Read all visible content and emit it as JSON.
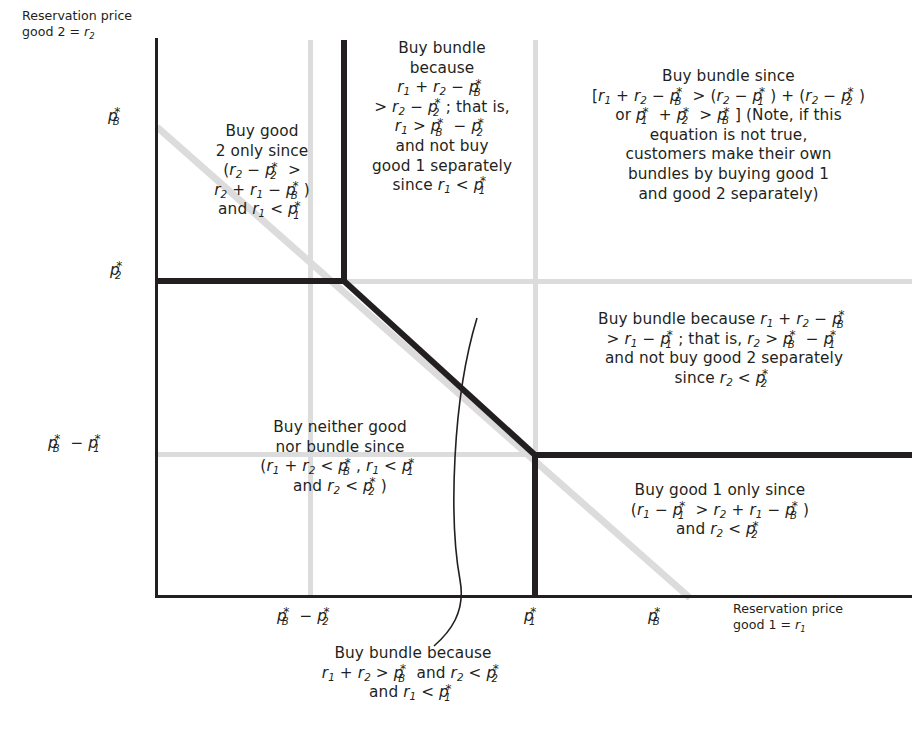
{
  "diagram": {
    "axes": {
      "y_label_line1": "Reservation price",
      "y_label_line2": "good 2 = r₂",
      "x_label_line1": "Reservation price",
      "x_label_line2": "good 1 = r₁",
      "y_ticks": [
        "p*_B",
        "p*_2",
        "p*_B − p*_1"
      ],
      "x_ticks": [
        "p*_B − p*_2",
        "p*_1",
        "p*_B"
      ]
    },
    "colors": {
      "ink": "#231f20",
      "grid_gray": "#dcdcdc",
      "background": "#ffffff"
    },
    "regions": [
      {
        "name": "buy-good-2-only",
        "lines": [
          "Buy good",
          "2 only since",
          "(r₂ − p*₂ >",
          "r₂ + r₁ − p*_B)",
          "and r₁ < p*₁"
        ]
      },
      {
        "name": "buy-bundle-top-middle",
        "lines": [
          "Buy bundle",
          "because",
          "r₁ + r₂ − p*_B",
          "> r₂ − p*₂; that is,",
          "r₁ > p*_B − p*₂",
          "and not buy",
          "good 1 separately",
          "since r₁ < p*₁"
        ]
      },
      {
        "name": "buy-bundle-top-right",
        "lines": [
          "Buy bundle since",
          "[r₁ + r₂ − p*_B > (r₂ − p*₁) + (r₂ − p*₂)",
          "or p*₁ + p*₂ > p*_B] (Note, if this",
          "equation is not true,",
          "customers make their own",
          "bundles by buying good 1",
          "and good 2 separately)"
        ]
      },
      {
        "name": "buy-bundle-middle-right",
        "lines": [
          "Buy bundle because r₁ + r₂ − p*_B",
          "> r₁ − p*₁; that is, r₂ > p*_B − p*₁",
          "and not buy good 2 separately",
          "since r₂ < p*₂"
        ]
      },
      {
        "name": "buy-neither",
        "lines": [
          "Buy neither good",
          "nor bundle since",
          "(r₁ + r₂ < p*_B, r₁ < p*₁",
          "and r₂ < p*₂)"
        ]
      },
      {
        "name": "buy-good-1-only",
        "lines": [
          "Buy good 1 only since",
          "(r₁ − p*₁ > r₂ + r₁ − p*_B)",
          "and r₂ < p*₂"
        ]
      },
      {
        "name": "buy-bundle-callout",
        "lines": [
          "Buy bundle because",
          "r₁ + r₂ > p*_B and r₂ < p*₂",
          "and r₁ < p*₁"
        ]
      }
    ]
  }
}
